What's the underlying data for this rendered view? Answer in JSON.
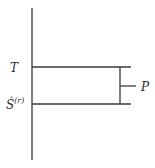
{
  "diagram": {
    "type": "level-diagram",
    "axis": "vertical-axis",
    "levels": [
      {
        "label": "T",
        "position": "upper"
      },
      {
        "label": "Ṡ",
        "superscript": "(r)",
        "position": "lower"
      }
    ],
    "bracket_label": "P",
    "colors": {
      "line": "#3a3a3a",
      "text": "#2a2a2a",
      "background": "#ffffff"
    }
  }
}
